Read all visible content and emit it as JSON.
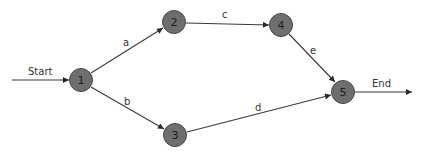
{
  "diagram": {
    "type": "activity-on-arrow network",
    "colors": {
      "node_fill": "#6e6e6e",
      "node_stroke": "#4a4a4a",
      "edge": "#3a3a3a",
      "text": "#1e1e1e"
    },
    "nodes": [
      {
        "id": "1",
        "label": "1",
        "x": 81,
        "y": 80
      },
      {
        "id": "2",
        "label": "2",
        "x": 174,
        "y": 22
      },
      {
        "id": "3",
        "label": "3",
        "x": 175,
        "y": 135
      },
      {
        "id": "4",
        "label": "4",
        "x": 281,
        "y": 25
      },
      {
        "id": "5",
        "label": "5",
        "x": 343,
        "y": 92
      }
    ],
    "edges": [
      {
        "from": "start",
        "to": "1",
        "label": "Start"
      },
      {
        "from": "1",
        "to": "2",
        "label": "a"
      },
      {
        "from": "1",
        "to": "3",
        "label": "b"
      },
      {
        "from": "2",
        "to": "4",
        "label": "c"
      },
      {
        "from": "3",
        "to": "5",
        "label": "d"
      },
      {
        "from": "4",
        "to": "5",
        "label": "e"
      },
      {
        "from": "5",
        "to": "end",
        "label": "End"
      }
    ]
  }
}
